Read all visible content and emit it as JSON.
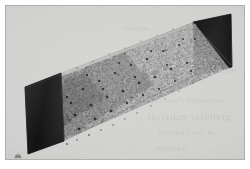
{
  "figure": {
    "kind": "scanned-scientific-illustration",
    "caption_visible": false,
    "orientation": "oblique perspective, long axis running from lower-left foreground to upper-right background",
    "artifact_label": "scanner-smudge"
  },
  "colors": {
    "page_white": "#ffffff",
    "plate_gray": "#d6d6d4",
    "plate_gray_light": "#dedede",
    "plate_gray_dark": "#c6c6c3",
    "endcap_black": "#1a1a1a",
    "endcap_black_soft": "#2a2a2a",
    "particle_dark": "#202020",
    "particle_mid": "#4a4a4a",
    "particle_light": "#8c8c8c",
    "edge_line": "#111111",
    "showthrough_ink": "#3a3a38"
  },
  "geometry": {
    "plate": {
      "x": 5,
      "y": 5,
      "width": 240,
      "height": 155
    },
    "near_endcap_label": "near end cap (lower-left)",
    "far_endcap_label": "far end cap (upper-right)",
    "near_endcap_points": "20,83 55,69 58,137 22,148",
    "far_endcap_points": "188,17 225,10 226,62 190,70",
    "duct_top_face_points": "20,83 188,17 225,10 58,69",
    "duct_bottom_face_points": "22,148 190,70 226,62 58,137",
    "particle_column_points": "24,84 190,19 224,63 57,136"
  },
  "showthrough_text": {
    "line_a": "interaction of the",
    "line_b": "measured flow rate",
    "line_c": "granular material",
    "line_d": "in the channel",
    "line_e": "particles",
    "line_f": "section"
  },
  "particles": {
    "count_rendered": 2600,
    "description": "dense randomly packed near-spherical grains filling the duct volume",
    "density_note": "packing thins toward the far upper-right end"
  }
}
